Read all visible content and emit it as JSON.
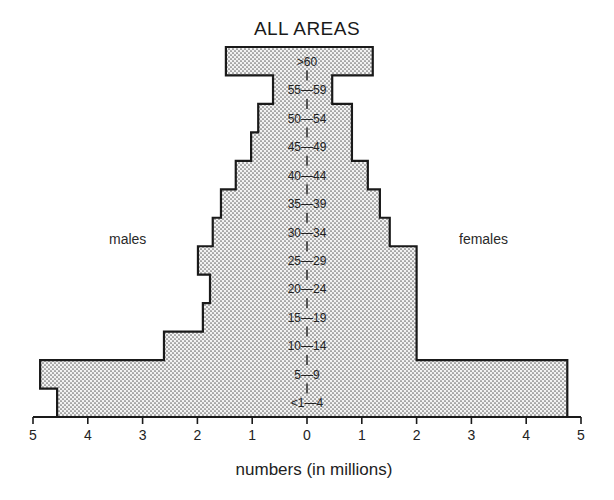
{
  "chart_data": {
    "type": "bar",
    "subtype": "population-pyramid",
    "title": "ALL AREAS",
    "xlabel": "numbers (in millions)",
    "ylabel": "",
    "left_label": "males",
    "right_label": "females",
    "categories": [
      ">60",
      "55—59",
      "50—54",
      "45—49",
      "40—44",
      "35—39",
      "30—34",
      "25—29",
      "20—24",
      "15—19",
      "10—14",
      "5—9",
      "<1—4"
    ],
    "series": [
      {
        "name": "males",
        "side": "left",
        "values": [
          1.48,
          0.62,
          0.89,
          1.02,
          1.3,
          1.57,
          1.72,
          1.99,
          1.77,
          1.9,
          2.61,
          4.87,
          4.56
        ]
      },
      {
        "name": "females",
        "side": "right",
        "values": [
          1.2,
          0.46,
          0.82,
          0.82,
          1.11,
          1.33,
          1.51,
          2.0,
          2.0,
          2.0,
          2.0,
          4.75,
          4.75
        ]
      }
    ],
    "xlim": [
      -5,
      5
    ],
    "x_ticks": [
      5,
      4,
      3,
      2,
      1,
      0,
      1,
      2,
      3,
      4,
      5
    ],
    "grid": false,
    "legend": "none",
    "fill_pattern": "dotted"
  }
}
